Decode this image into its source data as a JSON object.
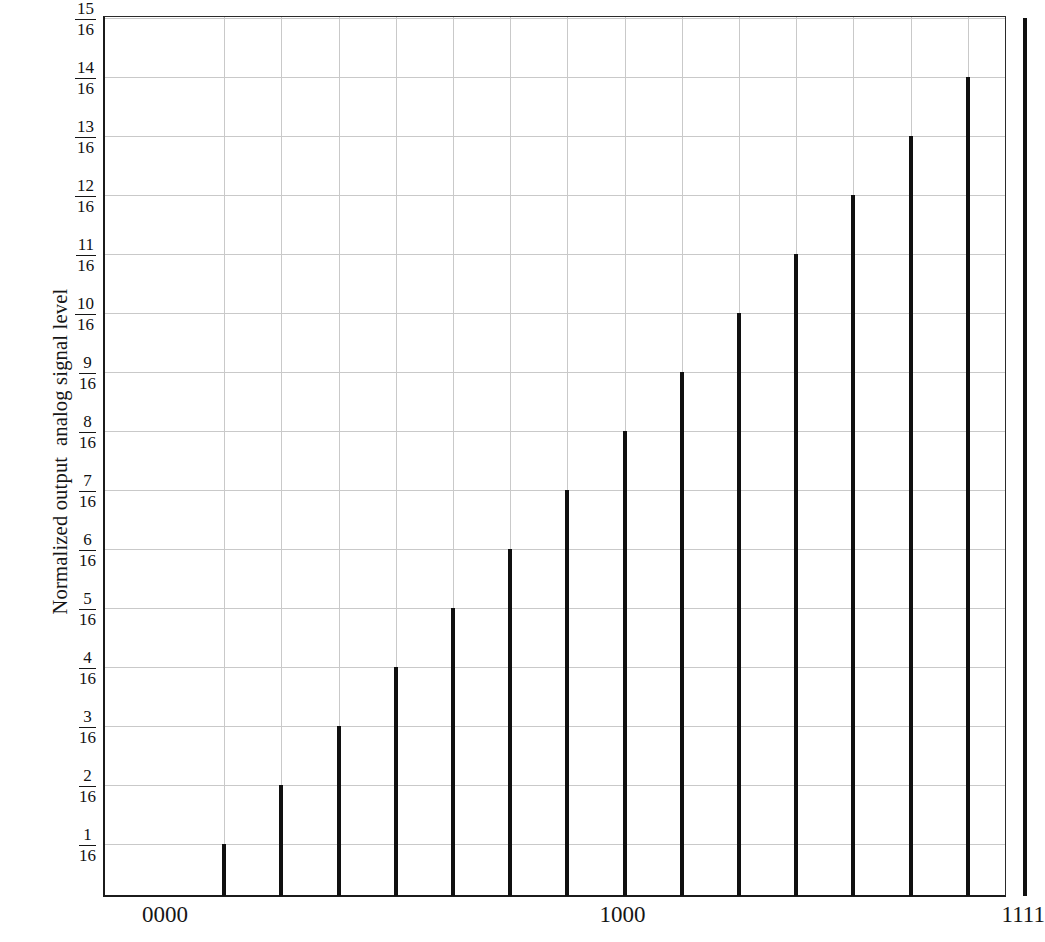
{
  "chart_data": {
    "type": "bar",
    "title": "",
    "xlabel": "",
    "ylabel": "Normalized output  analog signal level",
    "categories": [
      "0000",
      "0001",
      "0010",
      "0011",
      "0100",
      "0101",
      "0110",
      "0111",
      "1000",
      "1001",
      "1010",
      "1011",
      "1100",
      "1101",
      "1110",
      "1111"
    ],
    "values": [
      0,
      0.0625,
      0.125,
      0.1875,
      0.25,
      0.3125,
      0.375,
      0.4375,
      0.5,
      0.5625,
      0.625,
      0.6875,
      0.75,
      0.8125,
      0.875,
      0.9375
    ],
    "bar_labels": [
      "1/16",
      "2/16",
      "3/16",
      "4/16",
      "5/16",
      "6/16",
      "7/16",
      "8/16",
      "9/16",
      "10/16",
      "11/16",
      "12/16",
      "13/16",
      "14/16",
      "15/16"
    ],
    "ylim": [
      0,
      1.0
    ],
    "ytick_numerators": [
      1,
      2,
      3,
      4,
      5,
      6,
      7,
      8,
      9,
      10,
      11,
      12,
      13,
      14,
      15
    ],
    "ytick_denominator": "16",
    "xtick_labels": [
      "0000",
      "1000",
      "1111"
    ],
    "xtick_codes": [
      0,
      8,
      15
    ],
    "grid": true,
    "legend": "none",
    "bar_color": "#101010",
    "grid_color": "#c9c9c9",
    "axis_color": "#1b1b1b"
  },
  "axes": {
    "y_title": "Normalized output  analog signal level"
  }
}
